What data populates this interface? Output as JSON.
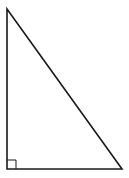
{
  "diagram": {
    "type": "right-triangle",
    "stroke_color": "#1a1a1a",
    "background": "#ffffff",
    "vertices": {
      "top": [
        7,
        9
      ],
      "bottom_left": [
        7,
        169
      ],
      "bottom_right": [
        122,
        169
      ]
    },
    "right_angle_marker": {
      "corner": "bottom_left",
      "size": 9
    },
    "labels": []
  }
}
